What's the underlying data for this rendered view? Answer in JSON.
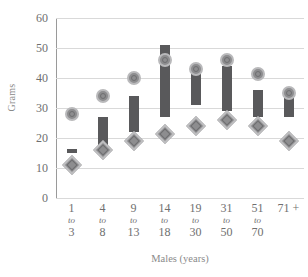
{
  "chart_data": {
    "type": "bar",
    "title": "",
    "xlabel": "Males (years)",
    "ylabel": "Grams",
    "ylim": [
      0,
      60
    ],
    "yticks": [
      0,
      10,
      20,
      30,
      40,
      50,
      60
    ],
    "grid": true,
    "legend": "none",
    "categories": [
      "1 to 3",
      "4 to 8",
      "9 to 13",
      "14 to 18",
      "19 to 30",
      "31 to 50",
      "51 to 70",
      "71 +"
    ],
    "category_parts": [
      {
        "start": "1",
        "to": "to",
        "end": "3"
      },
      {
        "start": "4",
        "to": "to",
        "end": "8"
      },
      {
        "start": "9",
        "to": "to",
        "end": "13"
      },
      {
        "start": "14",
        "to": "to",
        "end": "18"
      },
      {
        "start": "19",
        "to": "to",
        "end": "30"
      },
      {
        "start": "31",
        "to": "to",
        "end": "50"
      },
      {
        "start": "51",
        "to": "to",
        "end": "70"
      },
      {
        "start": "71 +",
        "to": "",
        "end": ""
      }
    ],
    "series": [
      {
        "name": "range-bar",
        "type": "range",
        "low": [
          15.5,
          15.5,
          22.0,
          27.0,
          31.0,
          29.0,
          27.0,
          27.0
        ],
        "high": [
          16.5,
          27.0,
          34.0,
          51.0,
          44.0,
          44.0,
          36.0,
          34.0
        ]
      },
      {
        "name": "circle-marker",
        "type": "point",
        "values": [
          28.0,
          34.0,
          40.0,
          46.0,
          43.0,
          46.0,
          41.5,
          35.0
        ]
      },
      {
        "name": "diamond-marker",
        "type": "point",
        "values": [
          11.0,
          16.0,
          19.0,
          21.5,
          24.0,
          26.0,
          24.0,
          19.0
        ]
      }
    ],
    "colors": {
      "bar": "#59595b",
      "circle_fill": "#8d8d8f",
      "circle_ring": "#b9b9bb",
      "diamond_fill": "#8d8d8f",
      "diamond_ring": "#bdbdbf",
      "gridline": "#d9d9d9",
      "axis": "#9a9a9a",
      "text": "#6f6f6f"
    }
  }
}
